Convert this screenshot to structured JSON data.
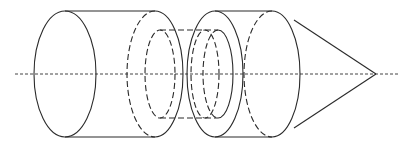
{
  "diagram": {
    "colors": {
      "stroke": "#2a2a2a",
      "axis": "#444444",
      "background": "#ffffff"
    },
    "axis": {
      "y": 74,
      "x_start": 15,
      "x_end": 398,
      "style": "dashed"
    },
    "components": [
      {
        "name": "left-cylinder",
        "left_ellipse": {
          "cx": 65,
          "rx": 31,
          "ry": 63
        },
        "right_ellipse_hidden": {
          "cx": 155,
          "rx": 28,
          "ry": 63
        }
      },
      {
        "name": "inner-tube",
        "left_ellipse_hidden": {
          "cx": 160,
          "rx": 15,
          "ry": 44
        },
        "right_ellipse": {
          "cx": 218,
          "rx": 15,
          "ry": 44
        }
      },
      {
        "name": "right-cylinder",
        "left_ellipse": {
          "cx": 215,
          "rx": 28,
          "ry": 63
        },
        "right_ellipse_hidden": {
          "cx": 272,
          "rx": 28,
          "ry": 63
        }
      },
      {
        "name": "cone",
        "tip": {
          "x": 376,
          "y": 74
        }
      }
    ]
  }
}
